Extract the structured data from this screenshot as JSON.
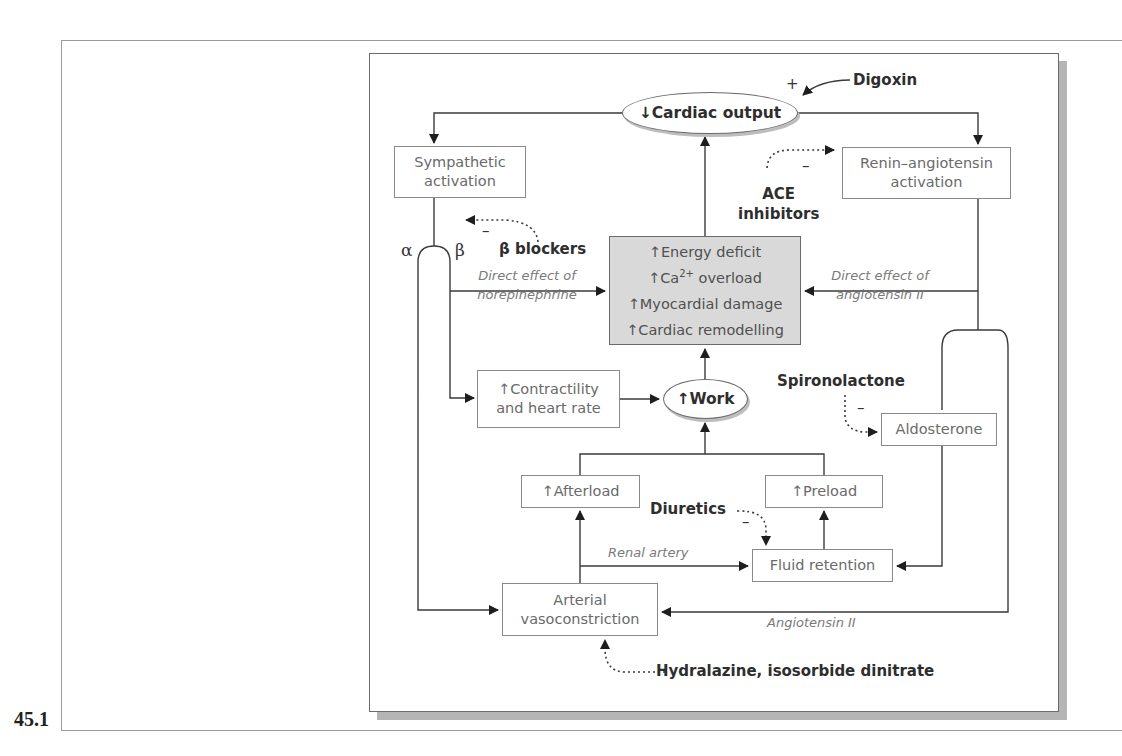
{
  "figure": {
    "label": "45.1"
  },
  "nodes": {
    "cardiac_output": "↓Cardiac output",
    "sympathetic": [
      "Sympathetic",
      "activation"
    ],
    "renin": [
      "Renin–angiotensin",
      "activation"
    ],
    "central": {
      "line1": "↑Energy deficit",
      "line2_prefix": "↑Ca",
      "line2_sup": "2+",
      "line2_suffix": " overload",
      "line3": "↑Myocardial damage",
      "line4": "↑Cardiac remodelling"
    },
    "contractility": [
      "↑Contractility",
      "and heart rate"
    ],
    "work": "↑Work",
    "afterload": "↑Afterload",
    "preload": "↑Preload",
    "aldosterone": "Aldosterone",
    "fluid_retention": "Fluid retention",
    "vasoconstriction": [
      "Arterial",
      "vasoconstriction"
    ]
  },
  "drugs": {
    "digoxin": "Digoxin",
    "ace_inhibitors": [
      "ACE",
      "inhibitors"
    ],
    "beta_blockers": "β blockers",
    "spironolactone": "Spironolactone",
    "diuretics": "Diuretics",
    "hydralazine": "Hydralazine, isosorbide dinitrate"
  },
  "edge_labels": {
    "norepinephrine": [
      "Direct effect of",
      "norepinephrine"
    ],
    "angiotensin_direct": [
      "Direct effect of",
      "angiotensin II"
    ],
    "renal_artery": "Renal artery",
    "angiotensin_ii": "Angiotensin II",
    "alpha": "α",
    "beta": "β"
  },
  "signs": {
    "plus": "+",
    "minus": "–"
  }
}
